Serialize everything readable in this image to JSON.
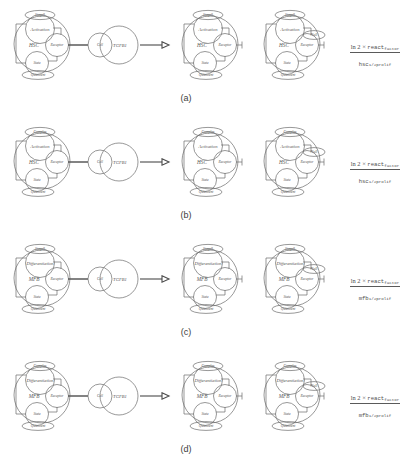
{
  "figure": {
    "type": "reaction-rule-diagram",
    "arrow_icon": "right-arrow-icon"
  },
  "common": {
    "ligand_cell_label": "Cell",
    "ligand_label": "TGFB1",
    "receptor_label": "Receptor",
    "state_label": "State",
    "null_label": "Null",
    "quiescent_label": "Quiescent"
  },
  "panels": [
    {
      "id": "a",
      "caption": "(a)",
      "cell_label": "HSC",
      "process_label": "Activation",
      "top_ellipse_label": "Stage0",
      "bottom_ellipse_label": "Quiescent",
      "ligand_cell_label": "Cell",
      "ligand_label": "TGFB1",
      "receptor_label": "Receptor",
      "state_label": "State",
      "null_label": "Null",
      "formula": {
        "numerator_prefix": "ln 2 × ",
        "numerator_mono": "react",
        "numerator_sub": "factor",
        "denominator_mono": "hsc",
        "denominator_sub": "1/2prolif"
      }
    },
    {
      "id": "b",
      "caption": "(b)",
      "cell_label": "HSC",
      "process_label": "Activation",
      "top_ellipse_label": "Complex",
      "bottom_ellipse_label": "Quiescent",
      "ligand_cell_label": "Cell",
      "ligand_label": "TGFB1",
      "receptor_label": "Receptor",
      "state_label": "State",
      "null_label": "Null",
      "formula": {
        "numerator_prefix": "ln 2 × ",
        "numerator_mono": "react",
        "numerator_sub": "factor",
        "denominator_mono": "hsc",
        "denominator_sub": "1/2prolif"
      }
    },
    {
      "id": "c",
      "caption": "(c)",
      "cell_label": "MFB",
      "process_label": "Differentiation",
      "top_ellipse_label": "Stage0",
      "bottom_ellipse_label": "Quiescent",
      "ligand_cell_label": "Cell",
      "ligand_label": "TGFB1",
      "receptor_label": "Receptor",
      "state_label": "State",
      "null_label": "Null",
      "formula": {
        "numerator_prefix": "ln 2 × ",
        "numerator_mono": "react",
        "numerator_sub": "factor",
        "denominator_mono": "mfb",
        "denominator_sub": "1/2prolif"
      }
    },
    {
      "id": "d",
      "caption": "(d)",
      "cell_label": "MFB",
      "process_label": "Differentiation",
      "top_ellipse_label": "Complex",
      "bottom_ellipse_label": "Quiescent",
      "ligand_cell_label": "Cell",
      "ligand_label": "TGFB1",
      "receptor_label": "Receptor",
      "state_label": "State",
      "null_label": "Null",
      "formula": {
        "numerator_prefix": "ln 2 × ",
        "numerator_mono": "react",
        "numerator_sub": "factor",
        "denominator_mono": "mfb",
        "denominator_sub": "1/2prolif"
      }
    }
  ],
  "colors": {
    "stroke": "#6b6b6b",
    "text": "#555555",
    "background": "#ffffff"
  }
}
